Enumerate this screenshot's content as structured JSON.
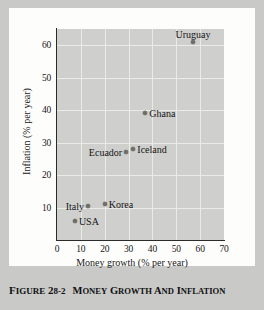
{
  "caption": {
    "figure_number": "FIGURE 28-2",
    "title": "MONEY GROWTH AND INFLATION"
  },
  "chart_data": {
    "type": "scatter",
    "title": "Money growth and inflation",
    "xlabel": "Money growth (% per year)",
    "ylabel": "Inflation (% per year)",
    "xlim": [
      0,
      70
    ],
    "ylim": [
      0,
      65
    ],
    "xticks": [
      0,
      10,
      20,
      30,
      40,
      50,
      60,
      70
    ],
    "yticks": [
      10,
      20,
      30,
      40,
      50,
      60
    ],
    "xtick_labels": [
      "0",
      "10",
      "20",
      "30",
      "40",
      "50",
      "60",
      "70"
    ],
    "ytick_labels": [
      "10",
      "20",
      "30",
      "40",
      "50",
      "60"
    ],
    "grid": true,
    "legend": false,
    "plot_bg_color": "#cfcfcd",
    "grid_color": "#eaeae6",
    "marker_color": "#6d6d6b",
    "points": [
      {
        "label": "Uruguay",
        "x": 57.0,
        "y": 61.0,
        "label_pos": "above"
      },
      {
        "label": "Ghana",
        "x": 37.0,
        "y": 39.0,
        "label_pos": "right"
      },
      {
        "label": "Iceland",
        "x": 32.0,
        "y": 28.0,
        "label_pos": "right"
      },
      {
        "label": "Ecuador",
        "x": 29.0,
        "y": 27.0,
        "label_pos": "left"
      },
      {
        "label": "Korea",
        "x": 20.0,
        "y": 11.0,
        "label_pos": "right"
      },
      {
        "label": "Italy",
        "x": 13.0,
        "y": 10.5,
        "label_pos": "left"
      },
      {
        "label": "USA",
        "x": 7.5,
        "y": 6.0,
        "label_pos": "right"
      }
    ]
  }
}
